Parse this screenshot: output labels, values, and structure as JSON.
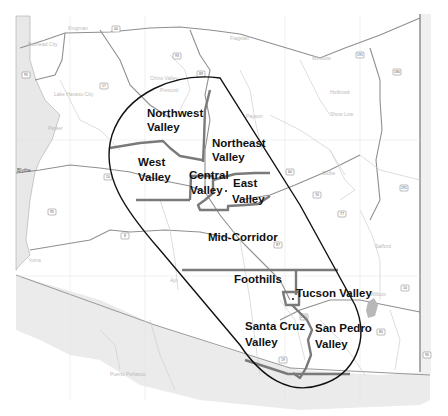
{
  "map": {
    "title": "Regional Planning Areas",
    "colors": {
      "background": "#ffffff",
      "neighbor_shade": "#e4e4e4",
      "boundary_line": "#777777",
      "capsule_outline": "#111111",
      "road": "#9a9a9a",
      "minor_road": "#cfcfcf",
      "label": "#111111"
    },
    "regions": [
      {
        "id": "northwest-valley",
        "line1": "Northwest",
        "line2": "Valley"
      },
      {
        "id": "northeast-valley",
        "line1": "Northeast",
        "line2": "Valley"
      },
      {
        "id": "west-valley",
        "line1": "West",
        "line2": "Valley"
      },
      {
        "id": "central-valley",
        "line1": "Central",
        "line2": "Valley"
      },
      {
        "id": "east-valley",
        "line1": "East",
        "line2": "Valley"
      },
      {
        "id": "mid-corridor",
        "line1": "Mid-Corridor"
      },
      {
        "id": "foothills",
        "line1": "Foothills"
      },
      {
        "id": "tucson-valley",
        "line1": "Tucson Valley"
      },
      {
        "id": "santa-cruz-valley",
        "line1": "Santa Cruz",
        "line2": "Valley"
      },
      {
        "id": "san-pedro-valley",
        "line1": "San Pedro",
        "line2": "Valley"
      }
    ],
    "background_places": [
      {
        "name": "Bullhead City"
      },
      {
        "name": "Kingman"
      },
      {
        "name": "Lake Havasu City"
      },
      {
        "name": "Parker"
      },
      {
        "name": "Blythe"
      },
      {
        "name": "Flagstaff"
      },
      {
        "name": "Winslow"
      },
      {
        "name": "Holbrook"
      },
      {
        "name": "Payson"
      },
      {
        "name": "Show Low"
      },
      {
        "name": "Globe"
      },
      {
        "name": "Safford"
      },
      {
        "name": "Yuma"
      },
      {
        "name": "Ajo"
      },
      {
        "name": "Willcox"
      },
      {
        "name": "Puerto Peñasco"
      },
      {
        "name": "Chino Valley"
      },
      {
        "name": "Prescott"
      }
    ],
    "highway_shields": [
      "40",
      "93",
      "89",
      "17",
      "10",
      "8",
      "60",
      "87",
      "180",
      "191",
      "191",
      "77",
      "70",
      "10",
      "19",
      "80",
      "95",
      "95",
      "260",
      "90"
    ]
  }
}
